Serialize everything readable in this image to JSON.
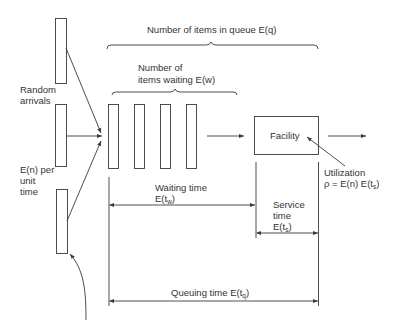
{
  "labels": {
    "queue_count": "Number of items in queue E(q)",
    "waiting_count_line1": "Number of",
    "waiting_count_line2": "items waiting E(w)",
    "random_arrivals_line1": "Random",
    "random_arrivals_line2": "arrivals",
    "rate_line1": "E(n) per",
    "rate_line2": "unit",
    "rate_line3": "time",
    "facility": "Facility",
    "utilization_line1": "Utilization",
    "utilization_line2_prefix": "ρ = E(n) E(t",
    "utilization_line2_sub": "s",
    "utilization_line2_suffix": ")",
    "waiting_time_line1": "Waiting time",
    "waiting_time_prefix": "E(t",
    "waiting_time_sub": "w",
    "waiting_time_suffix": ")",
    "service_time_line1": "Service",
    "service_time_line2": "time",
    "service_time_prefix": "E(t",
    "service_time_sub": "s",
    "service_time_suffix": ")",
    "queuing_time_prefix": "Queuing time E(t",
    "queuing_time_sub": "q",
    "queuing_time_suffix": ")"
  },
  "structure": {
    "arrival_sources": 3,
    "queue_slots": 4,
    "service_facilities": 1
  },
  "colors": {
    "stroke": "#3a3a3a",
    "background": "#ffffff"
  }
}
